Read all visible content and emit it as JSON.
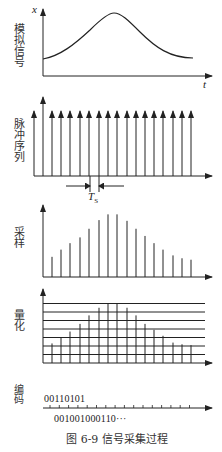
{
  "figure": {
    "caption": "图 6-9   信号采集过程",
    "panels": [
      {
        "id": "analog",
        "label": "模拟信号",
        "y_axis_label": "x",
        "x_axis_label": "t"
      },
      {
        "id": "pulse",
        "label": "脉冲序列",
        "period_label": "T",
        "period_subscript": "S"
      },
      {
        "id": "sampling",
        "label": "采样"
      },
      {
        "id": "quantization",
        "label": "量化"
      },
      {
        "id": "encoding",
        "label": "编码",
        "code_top": "00110101",
        "code_bottom": "001001000110···"
      }
    ]
  },
  "chart_data": [
    {
      "type": "line",
      "title": "模拟信号",
      "xlabel": "t",
      "ylabel": "x",
      "description": "Smooth bell-shaped analog signal rising from low level to a peak mid-way and falling back",
      "x": [
        0,
        1,
        2,
        3,
        4,
        5,
        6,
        7,
        8,
        9,
        10,
        11,
        12,
        13,
        14,
        15,
        16
      ],
      "values": [
        0.28,
        0.36,
        0.45,
        0.53,
        0.6,
        0.72,
        0.85,
        0.97,
        1.0,
        0.96,
        0.86,
        0.73,
        0.62,
        0.5,
        0.4,
        0.32,
        0.3
      ]
    },
    {
      "type": "bar",
      "title": "脉冲序列",
      "description": "Uniform impulse train with sampling period Ts",
      "count": 18,
      "values": [
        1,
        1,
        1,
        1,
        1,
        1,
        1,
        1,
        1,
        1,
        1,
        1,
        1,
        1,
        1,
        1,
        1,
        1
      ]
    },
    {
      "type": "bar",
      "title": "采样",
      "categories": [
        1,
        2,
        3,
        4,
        5,
        6,
        7,
        8,
        9,
        10,
        11,
        12,
        13,
        14,
        15,
        16
      ],
      "values": [
        0.28,
        0.38,
        0.47,
        0.55,
        0.67,
        0.79,
        0.87,
        0.87,
        0.78,
        0.67,
        0.57,
        0.47,
        0.38,
        0.3,
        0.26,
        0.24
      ]
    },
    {
      "type": "bar",
      "title": "量化",
      "levels": 7,
      "categories": [
        1,
        2,
        3,
        4,
        5,
        6,
        7,
        8,
        9,
        10,
        11,
        12,
        13,
        14,
        15,
        16
      ],
      "values": [
        2.3,
        3.0,
        3.7,
        4.6,
        5.6,
        6.5,
        7.0,
        7.0,
        6.5,
        5.6,
        4.6,
        3.9,
        3.2,
        2.4,
        2.2,
        2.1
      ]
    }
  ]
}
